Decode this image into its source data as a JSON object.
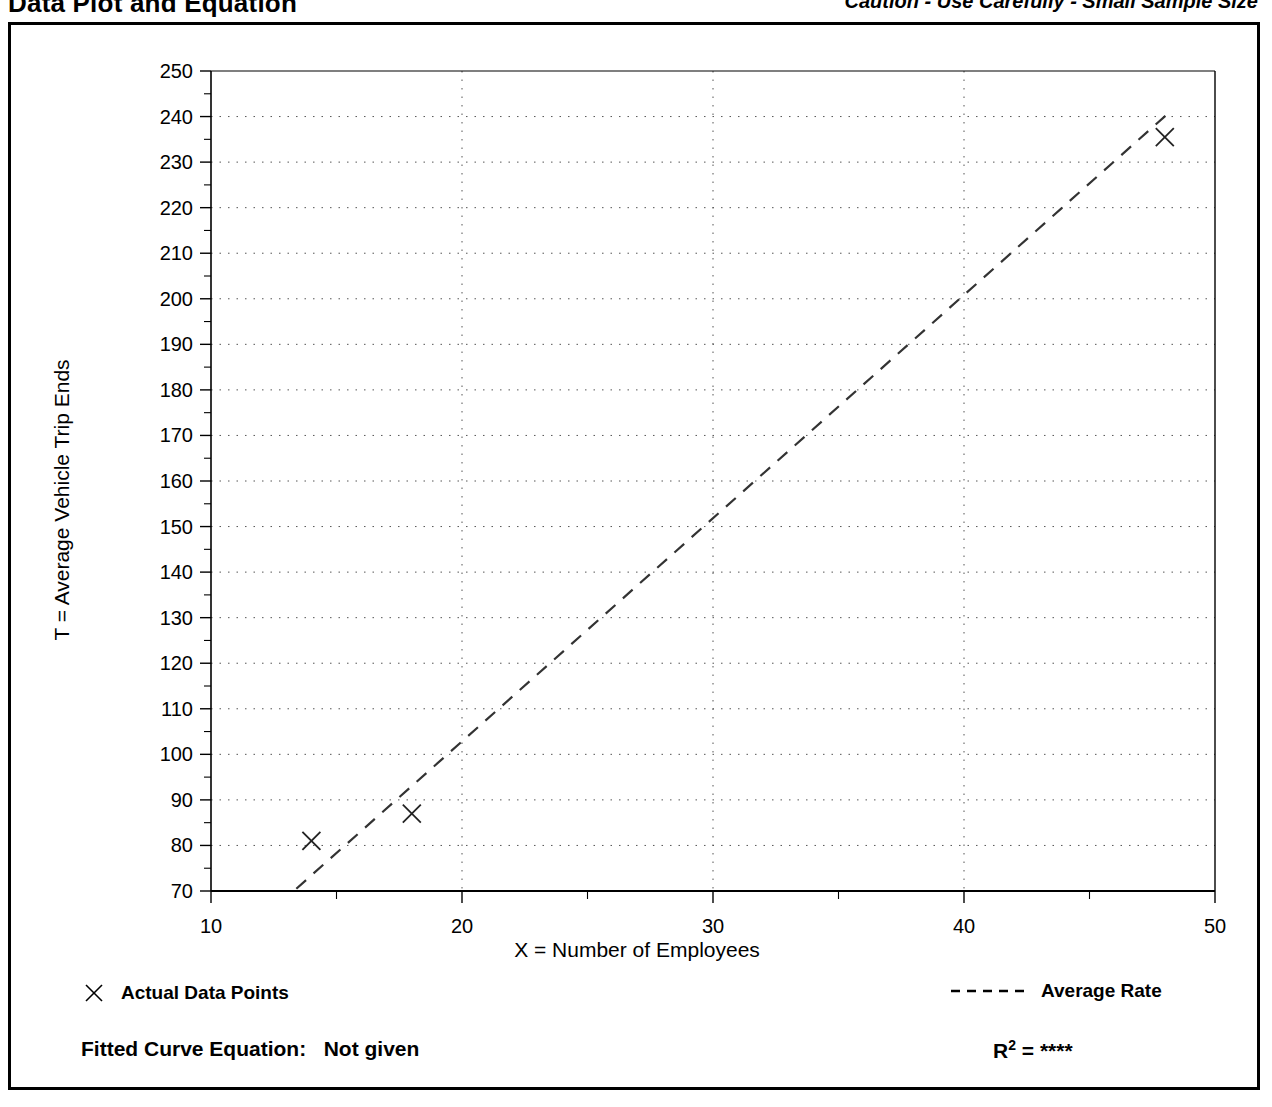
{
  "header": {
    "title": "Data Plot and Equation",
    "caution": "Caution - Use Carefully - Small Sample Size"
  },
  "legend": {
    "points_label": "Actual Data Points",
    "rate_label": "Average Rate",
    "points_marker": "x-marker-icon",
    "rate_marker": "dashed-line-icon"
  },
  "footer": {
    "fitted_equation_label": "Fitted Curve Equation:",
    "fitted_equation_value": "Not given",
    "r_label": "R",
    "r_exponent": "2",
    "r_equals": "=",
    "r_value": "****"
  },
  "chart_data": {
    "type": "scatter",
    "title": "Data Plot and Equation",
    "xlabel": "X = Number of Employees",
    "ylabel": "T = Average Vehicle Trip Ends",
    "xlim": [
      10,
      50
    ],
    "ylim": [
      70,
      250
    ],
    "xticks": [
      10,
      20,
      30,
      40,
      50
    ],
    "xtick_labels": [
      "10",
      "20",
      "30",
      "40",
      "50"
    ],
    "xminor_step": 5,
    "yticks": [
      70,
      80,
      90,
      100,
      110,
      120,
      130,
      140,
      150,
      160,
      170,
      180,
      190,
      200,
      210,
      220,
      230,
      240,
      250
    ],
    "ytick_labels": [
      "70",
      "80",
      "90",
      "100",
      "110",
      "120",
      "130",
      "140",
      "150",
      "160",
      "170",
      "180",
      "190",
      "200",
      "210",
      "220",
      "230",
      "240",
      "250"
    ],
    "yminor_step": 5,
    "grid": true,
    "grid_style": "dotted",
    "legend_position": "below-plot",
    "series": [
      {
        "name": "Actual Data Points",
        "type": "scatter",
        "marker": "x",
        "points": [
          {
            "x": 14,
            "y": 81
          },
          {
            "x": 18,
            "y": 87
          },
          {
            "x": 48,
            "y": 235.5
          }
        ]
      },
      {
        "name": "Average Rate",
        "type": "line",
        "style": "dashed",
        "points": [
          {
            "x": 13.4,
            "y": 70.5
          },
          {
            "x": 48.3,
            "y": 241.5
          }
        ]
      }
    ]
  }
}
